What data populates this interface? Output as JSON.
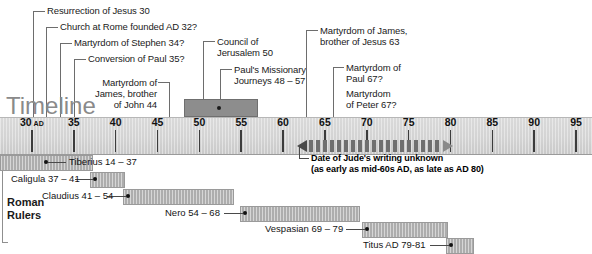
{
  "title_word": "Timeline",
  "axis": {
    "start_year": 30,
    "end_year": 95,
    "px_per_year": 8.37,
    "x_at_start": 32,
    "ticks": [
      {
        "year": 30,
        "label": "30",
        "suffix": " AD"
      },
      {
        "year": 35,
        "label": "35",
        "suffix": ""
      },
      {
        "year": 40,
        "label": "40",
        "suffix": ""
      },
      {
        "year": 45,
        "label": "45",
        "suffix": ""
      },
      {
        "year": 50,
        "label": "50",
        "suffix": ""
      },
      {
        "year": 55,
        "label": "55",
        "suffix": ""
      },
      {
        "year": 60,
        "label": "60",
        "suffix": ""
      },
      {
        "year": 65,
        "label": "65",
        "suffix": ""
      },
      {
        "year": 70,
        "label": "70",
        "suffix": ""
      },
      {
        "year": 75,
        "label": "75",
        "suffix": ""
      },
      {
        "year": 80,
        "label": "80",
        "suffix": ""
      },
      {
        "year": 85,
        "label": "85",
        "suffix": ""
      },
      {
        "year": 90,
        "label": "90",
        "suffix": ""
      },
      {
        "year": 95,
        "label": "95",
        "suffix": ""
      }
    ]
  },
  "events": [
    {
      "id": "resurrection",
      "text": "Resurrection of Jesus 30",
      "year": 30
    },
    {
      "id": "church-rome",
      "text": "Church at Rome founded AD 32?",
      "year": 32
    },
    {
      "id": "stephen",
      "text": "Martyrdom of Stephen 34?",
      "year": 34
    },
    {
      "id": "conversion-paul",
      "text": "Conversion of Paul 35?",
      "year": 35
    },
    {
      "id": "james-john",
      "text": "Martyrdom of\nJames, brother\nof John 44",
      "year": 44
    },
    {
      "id": "council-jerusalem",
      "text": "Council of\nJerusalem 50",
      "year": 50
    },
    {
      "id": "paul-journeys",
      "text": "Paul's Missionary\nJourneys 48 – 57",
      "year_start": 48,
      "year_end": 57,
      "marker_year": 52
    },
    {
      "id": "james-jesus",
      "text": "Martyrdom of James,\nbrother of Jesus 63",
      "year": 63
    },
    {
      "id": "paul-martyrdom",
      "text": "Martyrdom of\nPaul 67?",
      "year": 67
    },
    {
      "id": "peter-martyrdom",
      "text": "Martyrdom\nof Peter 67?",
      "year": 67
    }
  ],
  "jude": {
    "line1": "Date of Jude's writing unknown",
    "line2": "(as early as mid-60s AD, as late as AD 80)",
    "range_start": 62,
    "range_end": 80
  },
  "rulers_section": {
    "title": "Roman\nRulers",
    "rulers": [
      {
        "id": "tiberius",
        "label": "Tiberius 14 – 37",
        "start": 14,
        "end": 37,
        "label_side": "right"
      },
      {
        "id": "caligula",
        "label": "Caligula 37 – 41",
        "start": 37,
        "end": 41,
        "label_side": "left"
      },
      {
        "id": "claudius",
        "label": "Claudius 41 – 54",
        "start": 41,
        "end": 54,
        "label_side": "left"
      },
      {
        "id": "nero",
        "label": "Nero 54 – 68",
        "start": 54,
        "end": 68,
        "label_side": "left"
      },
      {
        "id": "vespasian",
        "label": "Vespasian 69 – 79",
        "start": 69,
        "end": 79,
        "label_side": "left"
      },
      {
        "id": "titus",
        "label": "Titus AD 79-81",
        "start": 79,
        "end": 81,
        "label_side": "left"
      }
    ]
  },
  "colors": {
    "axis_band": "#d4d4d4",
    "bar_fill": "#8d8d8d",
    "ruler_fill": "#adadad",
    "ink": "#1a1a1a",
    "leader": "#6d6d6d",
    "title_word": "#8a8a8a"
  }
}
